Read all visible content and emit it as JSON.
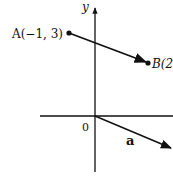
{
  "diagram": {
    "axes": {
      "x_label": "",
      "y_label": "y",
      "origin_label": "0"
    },
    "points": [
      {
        "name": "A",
        "label": "A(−1, 3)",
        "coords": [
          -1,
          3
        ]
      },
      {
        "name": "B",
        "label": "B(2",
        "coords_partial": "2"
      }
    ],
    "vectors": [
      {
        "name": "AB",
        "from": "A",
        "to": "B"
      },
      {
        "name": "a",
        "label": "a",
        "from": "origin"
      }
    ],
    "colors": {
      "stroke": "#111111",
      "background": "#ffffff"
    }
  }
}
